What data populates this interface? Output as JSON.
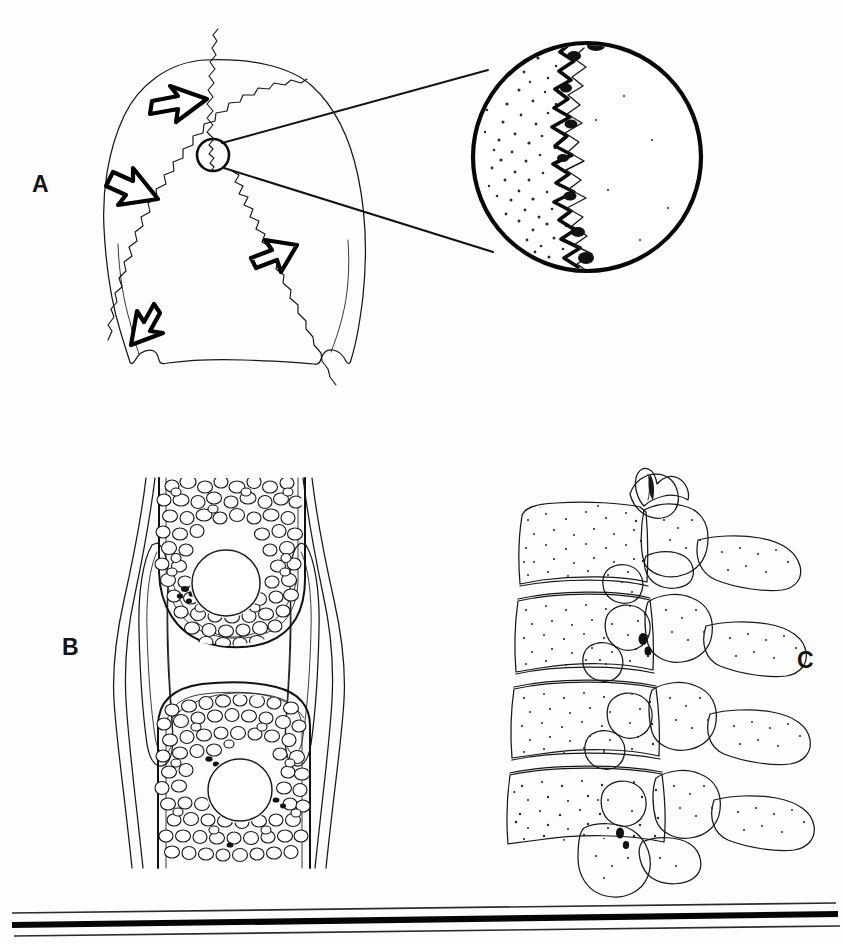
{
  "figure": {
    "kind": "anatomical-line-illustration",
    "background_color": "#fdfdfd",
    "ink_color": "#111111",
    "width": 843,
    "height": 944,
    "panels": [
      {
        "id": "A",
        "label": "A",
        "label_x": 32,
        "label_y": 192,
        "title": "Posterior skull with widened sutures",
        "description": "Posteroanterior view of a cranium showing irregular widened cranial sutures indicated by four open outlined arrows, with a small circular region of interest magnified in an adjacent inset circle.",
        "arrow_count": 4,
        "marker_circle": {
          "cx": 213,
          "cy": 155,
          "r": 16
        },
        "inset_circle": {
          "cx": 587,
          "cy": 157,
          "r": 115
        },
        "inset_description": "Magnified view of a single widened suture margin with dense stippling along the bone edge"
      },
      {
        "id": "B",
        "label": "B",
        "label_x": 62,
        "label_y": 655,
        "title": "Joint cross-section with subchondral lytic lesions",
        "description": "Coronal section through a synovial joint showing two opposing bone ends filled with trabecular bone, joint capsule with lateral recesses, and a rounded radiolucent lytic lesion in each epiphysis.",
        "lesions": [
          {
            "cx": 226,
            "cy": 583,
            "rx": 34,
            "ry": 33
          },
          {
            "cx": 240,
            "cy": 790,
            "rx": 32,
            "ry": 31
          }
        ]
      },
      {
        "id": "C",
        "label": "C",
        "label_x": 797,
        "label_y": 668,
        "title": "Lateral lumbar vertebrae",
        "description": "Lateral view of four stacked lumbar vertebral bodies with intervertebral disc spaces, pedicles, facet joints, and spinous processes; bone surfaces rendered with fine stippling.",
        "vertebra_count": 4
      }
    ],
    "footer_rules": {
      "description": "Three near-horizontal scan rules across the lower page edge",
      "count": 3,
      "lines": [
        {
          "x1": 12,
          "y1": 913,
          "x2": 836,
          "y2": 903,
          "weight": "thin"
        },
        {
          "x1": 12,
          "y1": 925,
          "x2": 838,
          "y2": 914,
          "weight": "bold"
        },
        {
          "x1": 14,
          "y1": 936,
          "x2": 840,
          "y2": 926,
          "weight": "thin"
        }
      ]
    }
  }
}
